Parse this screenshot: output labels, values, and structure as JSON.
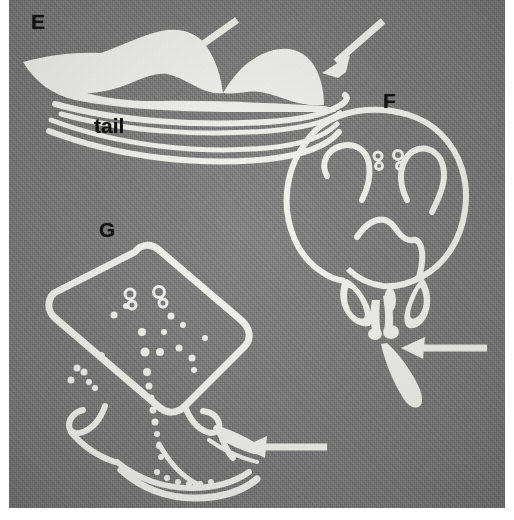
{
  "figure": {
    "kind": "scientific-figure-plate",
    "background_color": "#7c7c7c",
    "ink_color": "#f4f4f0",
    "label_color": "#121212",
    "page_color": "#ffffff",
    "panels": [
      {
        "id": "E",
        "label": "E",
        "view": "lateral",
        "description": "Lateral silhouette of two rounded dorsal mounds above an elongate tapering tail",
        "annotations": [
          "tail"
        ],
        "arrow_count": 2
      },
      {
        "id": "F",
        "label": "F",
        "view": "ventral",
        "description": "Rounded disc-shaped body outline with paired internal hook curves, two small spots and a central arched mouth, with pelvic fins and claspers below",
        "annotations": [],
        "arrow_count": 1
      },
      {
        "id": "G",
        "label": "G",
        "view": "dorsal",
        "description": "Diamond kite-shaped skate disc with scattered white denticle spots, a midline row of spots, pelvic fins and a tail",
        "annotations": [],
        "arrow_count": 1
      }
    ],
    "labels": {
      "panel_e": "E",
      "panel_f": "F",
      "panel_g": "G",
      "tail": "tail"
    }
  }
}
